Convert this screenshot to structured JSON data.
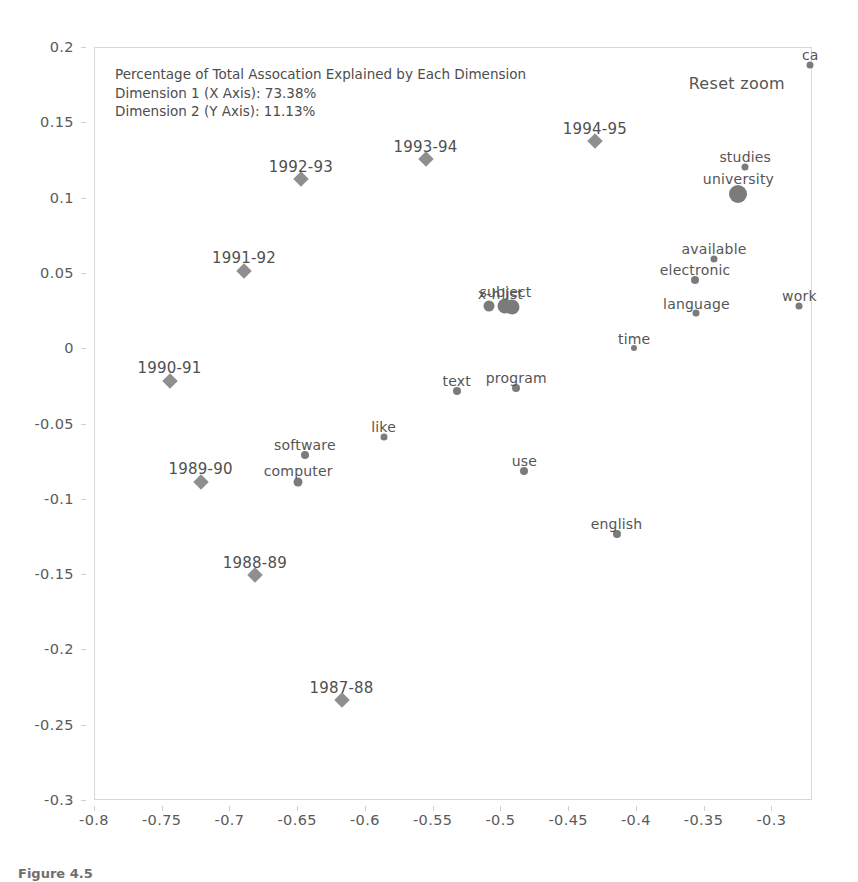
{
  "annotation": {
    "line1": "Percentage of Total Assocation Explained by Each Dimension",
    "line2": "Dimension 1 (X Axis): 73.38%",
    "line3": "Dimension 2 (Y Axis): 11.13%"
  },
  "controls": {
    "reset_zoom_label": "Reset zoom"
  },
  "caption": {
    "text": "Figure 4.5"
  },
  "colors": {
    "word_marker": "#7b7b7b",
    "year_marker": "#8f8f8f",
    "axis_text": "#5a5a5a",
    "frame": "#d8d8d8",
    "background": "#ffffff"
  },
  "chart_data": {
    "type": "scatter",
    "title": "",
    "xlabel": "",
    "ylabel": "",
    "xlim": [
      -0.8,
      -0.27
    ],
    "ylim": [
      -0.3,
      0.2
    ],
    "grid": false,
    "legend": "none",
    "xticks": [
      "-0.8",
      "-0.75",
      "-0.7",
      "-0.65",
      "-0.6",
      "-0.55",
      "-0.5",
      "-0.45",
      "-0.4",
      "-0.35",
      "-0.3"
    ],
    "xtickvalues": [
      -0.8,
      -0.75,
      -0.7,
      -0.65,
      -0.6,
      -0.55,
      -0.5,
      -0.45,
      -0.4,
      -0.35,
      -0.3
    ],
    "yticks": [
      "0.2",
      "0.15",
      "0.1",
      "0.05",
      "0",
      "-0.05",
      "-0.1",
      "-0.15",
      "-0.2",
      "-0.25",
      "-0.3"
    ],
    "ytickvalues": [
      0.2,
      0.15,
      0.1,
      0.05,
      0,
      -0.05,
      -0.1,
      -0.15,
      -0.2,
      -0.25,
      -0.3
    ],
    "series": [
      {
        "name": "years",
        "marker": "diamond",
        "color": "#8f8f8f",
        "points": [
          {
            "label": "1987-88",
            "x": -0.618,
            "y": -0.233,
            "size": 11
          },
          {
            "label": "1988-89",
            "x": -0.682,
            "y": -0.15,
            "size": 11
          },
          {
            "label": "1989-90",
            "x": -0.722,
            "y": -0.088,
            "size": 11
          },
          {
            "label": "1990-91",
            "x": -0.745,
            "y": -0.021,
            "size": 11
          },
          {
            "label": "1991-92",
            "x": -0.69,
            "y": 0.052,
            "size": 11
          },
          {
            "label": "1992-93",
            "x": -0.648,
            "y": 0.113,
            "size": 11
          },
          {
            "label": "1993-94",
            "x": -0.556,
            "y": 0.126,
            "size": 11
          },
          {
            "label": "1994-95",
            "x": -0.431,
            "y": 0.138,
            "size": 11
          }
        ]
      },
      {
        "name": "words",
        "marker": "circle",
        "color": "#7b7b7b",
        "points": [
          {
            "label": "ca",
            "x": -0.272,
            "y": 0.189,
            "size": 7
          },
          {
            "label": "studies",
            "x": -0.32,
            "y": 0.121,
            "size": 7
          },
          {
            "label": "university",
            "x": -0.325,
            "y": 0.103,
            "size": 18
          },
          {
            "label": "available",
            "x": -0.343,
            "y": 0.06,
            "size": 7
          },
          {
            "label": "electronic",
            "x": -0.357,
            "y": 0.046,
            "size": 8
          },
          {
            "label": "work",
            "x": -0.28,
            "y": 0.029,
            "size": 7
          },
          {
            "label": "language",
            "x": -0.356,
            "y": 0.024,
            "size": 7
          },
          {
            "label": "x-h",
            "x": -0.509,
            "y": 0.029,
            "size": 11
          },
          {
            "label": "subject",
            "x": -0.497,
            "y": 0.029,
            "size": 15
          },
          {
            "label": "list",
            "x": -0.492,
            "y": 0.028,
            "size": 15
          },
          {
            "label": "time",
            "x": -0.402,
            "y": 0.001,
            "size": 6
          },
          {
            "label": "program",
            "x": -0.489,
            "y": -0.026,
            "size": 8
          },
          {
            "label": "text",
            "x": -0.533,
            "y": -0.028,
            "size": 8
          },
          {
            "label": "like",
            "x": -0.587,
            "y": -0.058,
            "size": 7
          },
          {
            "label": "software",
            "x": -0.645,
            "y": -0.07,
            "size": 8
          },
          {
            "label": "computer",
            "x": -0.65,
            "y": -0.088,
            "size": 9
          },
          {
            "label": "use",
            "x": -0.483,
            "y": -0.081,
            "size": 8
          },
          {
            "label": "english",
            "x": -0.415,
            "y": -0.123,
            "size": 8
          }
        ]
      }
    ]
  }
}
